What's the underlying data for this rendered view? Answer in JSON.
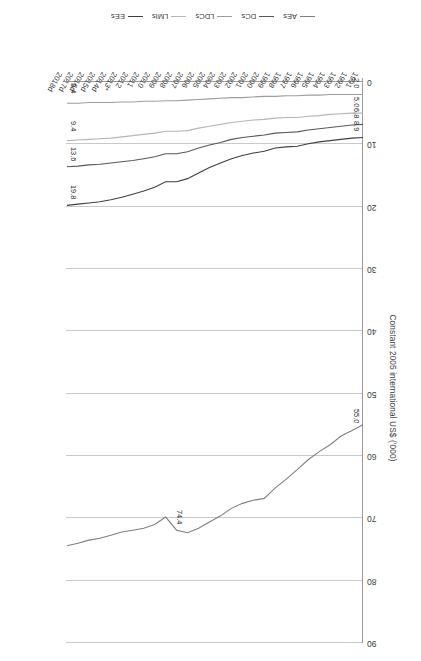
{
  "chart_data": {
    "type": "line",
    "title": "",
    "xlabel": "",
    "ylabel": "Constant 2005 international US$ ('000)",
    "ylim": [
      0,
      90
    ],
    "yticks": [
      0,
      10,
      20,
      30,
      40,
      50,
      60,
      70,
      80,
      90
    ],
    "ytick_labels": [
      "0",
      "10",
      "20",
      "30",
      "40",
      "50",
      "60",
      "70",
      "80",
      "90"
    ],
    "grid": true,
    "grid_axis": "y",
    "legend_position": "bottom",
    "categories": [
      "1991",
      "1992",
      "1993",
      "1994",
      "1995",
      "1996",
      "1997",
      "1998",
      "1999",
      "2000",
      "2001",
      "2002",
      "2003",
      "2004",
      "2005",
      "2006",
      "2007",
      "2008",
      "2009",
      "2010",
      "2011",
      "2012",
      "2013*",
      "2014d",
      "2015d",
      "2016d",
      "2017d",
      "2018d"
    ],
    "series": [
      {
        "name": "AEs",
        "color": "#7f7f7f",
        "start_label": "55.0",
        "end_label": "74.4",
        "values": [
          55.0,
          55.9,
          56.8,
          58.2,
          59.3,
          60.6,
          62.2,
          63.7,
          65.1,
          66.8,
          67.1,
          67.6,
          68.4,
          69.6,
          70.6,
          71.6,
          72.3,
          71.9,
          69.8,
          71.0,
          71.6,
          71.9,
          72.2,
          72.7,
          73.2,
          73.5,
          74.0,
          74.4
        ]
      },
      {
        "name": "DCs",
        "color": "#585858",
        "start_label": "6.8",
        "end_label": "13.6",
        "values": [
          6.8,
          6.9,
          7.1,
          7.3,
          7.5,
          7.7,
          8.0,
          8.1,
          8.2,
          8.5,
          8.7,
          8.9,
          9.2,
          9.7,
          10.1,
          10.6,
          11.2,
          11.5,
          11.5,
          12.0,
          12.3,
          12.6,
          12.8,
          13.0,
          13.2,
          13.3,
          13.5,
          13.6
        ]
      },
      {
        "name": "LDCs",
        "color": "#9d9d9d",
        "start_label": "2.0",
        "end_label": "3.4",
        "values": [
          2.0,
          2.0,
          2.0,
          2.0,
          2.1,
          2.1,
          2.2,
          2.2,
          2.3,
          2.3,
          2.4,
          2.5,
          2.5,
          2.6,
          2.7,
          2.8,
          2.9,
          3.0,
          3.0,
          3.1,
          3.1,
          3.2,
          3.2,
          3.3,
          3.3,
          3.3,
          3.4,
          3.4
        ]
      },
      {
        "name": "LMIs",
        "color": "#b5b5b5",
        "start_label": "5.0",
        "end_label": "9.4",
        "values": [
          5.0,
          5.0,
          5.1,
          5.2,
          5.4,
          5.5,
          5.7,
          5.7,
          5.8,
          6.0,
          6.1,
          6.3,
          6.5,
          6.8,
          7.1,
          7.4,
          7.8,
          7.9,
          7.9,
          8.2,
          8.4,
          8.6,
          8.8,
          9.0,
          9.1,
          9.2,
          9.3,
          9.4
        ]
      },
      {
        "name": "EEs",
        "color": "#3f3f3f",
        "start_label": "8.9",
        "end_label": "19.8",
        "values": [
          8.9,
          9.0,
          9.2,
          9.4,
          9.6,
          9.9,
          10.3,
          10.4,
          10.6,
          11.1,
          11.4,
          11.8,
          12.3,
          13.0,
          13.7,
          14.6,
          15.5,
          16.0,
          16.0,
          16.9,
          17.5,
          18.0,
          18.5,
          18.9,
          19.2,
          19.4,
          19.6,
          19.8
        ]
      }
    ],
    "point_labels": [
      {
        "text": "55.0",
        "series": "AEs",
        "at": "start"
      },
      {
        "text": "74.4",
        "series": "AEs",
        "at": "mid"
      },
      {
        "text": "8.9",
        "series": "EEs",
        "at": "start"
      },
      {
        "text": "6.8",
        "series": "DCs",
        "at": "start"
      },
      {
        "text": "5.0",
        "series": "LMIs",
        "at": "start"
      },
      {
        "text": "2.0",
        "series": "LDCs",
        "at": "start"
      },
      {
        "text": "19.8",
        "series": "EEs",
        "at": "end"
      },
      {
        "text": "13.6",
        "series": "DCs",
        "at": "end"
      },
      {
        "text": "9.4",
        "series": "LMIs",
        "at": "end"
      },
      {
        "text": "3.4",
        "series": "LDCs",
        "at": "end"
      }
    ],
    "legend": [
      "AEs",
      "DCs",
      "LDCs",
      "LMIs",
      "EEs"
    ]
  }
}
